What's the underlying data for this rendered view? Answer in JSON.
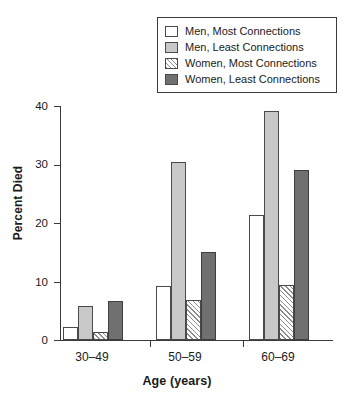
{
  "chart_data": {
    "type": "bar",
    "title": "",
    "subtitle": "",
    "xlabel": "Age (years)",
    "ylabel": "Percent Died",
    "categories": [
      "30–49",
      "50–59",
      "60–69"
    ],
    "series": [
      {
        "name": "Men, Most Connections",
        "values": [
          2.2,
          9.3,
          21.4
        ],
        "fill": "white",
        "color": "#ffffff"
      },
      {
        "name": "Men, Least Connections",
        "values": [
          5.8,
          30.5,
          39.1
        ],
        "fill": "light-gray",
        "color": "#c8c8c8"
      },
      {
        "name": "Women, Most Connections",
        "values": [
          1.3,
          6.9,
          9.4
        ],
        "fill": "hatched",
        "color": "#ffffff"
      },
      {
        "name": "Women, Least Connections",
        "values": [
          6.7,
          15.0,
          29.0
        ],
        "fill": "dark-gray",
        "color": "#707070"
      }
    ],
    "ylim": [
      0,
      40
    ],
    "yticks": [
      0,
      10,
      20,
      30,
      40
    ],
    "ytick_labels": [
      "0",
      "10",
      "20",
      "30",
      "40"
    ],
    "grid": false,
    "legend_position": "top-right",
    "legend_entries": [
      "Men, Most Connections",
      "Men, Least Connections",
      "Women, Most Connections",
      "Women, Least Connections"
    ]
  },
  "axes": {
    "y_title": "Percent Died",
    "x_title": "Age (years)",
    "y_ticks": [
      {
        "label": "40",
        "value": 40
      },
      {
        "label": "30",
        "value": 30
      },
      {
        "label": "20",
        "value": 20
      },
      {
        "label": "10",
        "value": 10
      },
      {
        "label": "0",
        "value": 0
      }
    ],
    "x_ticks": [
      {
        "label": "30–49"
      },
      {
        "label": "50–59"
      },
      {
        "label": "60–69"
      }
    ]
  },
  "legend": {
    "items": [
      {
        "label": "Men, Most Connections",
        "swatch": "swatch-white"
      },
      {
        "label": "Men, Least Connections",
        "swatch": "swatch-light-gray"
      },
      {
        "label": "Women, Most Connections",
        "swatch": "swatch-hatched"
      },
      {
        "label": "Women, Least Connections",
        "swatch": "swatch-dark-gray"
      }
    ]
  },
  "colors": {
    "series_white": "#ffffff",
    "series_light_gray": "#c8c8c8",
    "series_hatched": "#ffffff",
    "series_dark_gray": "#707070",
    "axis": "#3a3a3a",
    "text": "#1a1a1a"
  }
}
